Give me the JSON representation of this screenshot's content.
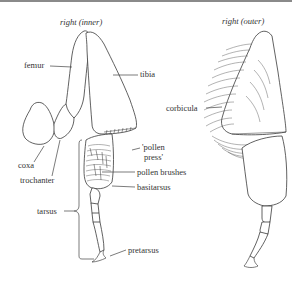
{
  "figure": {
    "left_view": {
      "title": "right (inner)",
      "labels": {
        "femur": "femur",
        "tibia": "tibia",
        "coxa": "coxa",
        "trochanter": "trochanter",
        "pollen_press_line1": "'pollen",
        "pollen_press_line2": "press'",
        "pollen_brushes": "pollen brushes",
        "basitarsus": "basitarsus",
        "tarsus": "tarsus",
        "pretarsus": "pretarsus"
      }
    },
    "right_view": {
      "title": "right (outer)",
      "labels": {
        "corbicula": "corbicula"
      }
    }
  }
}
